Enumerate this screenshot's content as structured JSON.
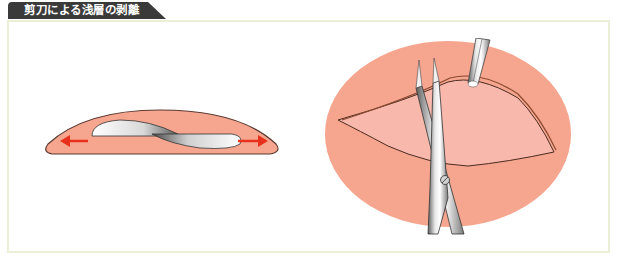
{
  "title": "剪刀による浅層の剥離",
  "colors": {
    "title_bg": "#3a3a3a",
    "frame_border": "#ecefd8",
    "skin": "#f6a58e",
    "skin_inner": "#f9b8ac",
    "outline": "#5a3a30",
    "arrow": "#e8311c",
    "metal_light": "#f2f2f2",
    "metal_dark": "#6f6f6f"
  },
  "figures": [
    {
      "id": "cross-section",
      "description": "Cross-section of skin flap with scissor blades spreading tissue; red arrows indicate outward spreading direction",
      "arrows": [
        "left",
        "right"
      ]
    },
    {
      "id": "top-view",
      "description": "Top view of oval wound with forceps lifting flap edge while curved scissors dissect the superficial layer"
    }
  ]
}
